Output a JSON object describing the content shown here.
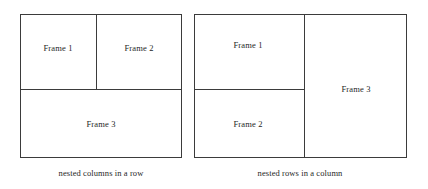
{
  "figure": {
    "background_color": "#ffffff",
    "line_color": "#3b3b3b",
    "text_color": "#1f1f1f"
  },
  "diagrams": [
    {
      "id": "nested-columns-in-a-row",
      "caption": "nested columns in a row",
      "frames": [
        {
          "label": "Frame 1",
          "position": "top-left"
        },
        {
          "label": "Frame 2",
          "position": "top-right"
        },
        {
          "label": "Frame 3",
          "position": "bottom-full-width"
        }
      ]
    },
    {
      "id": "nested-rows-in-a-column",
      "caption": "nested rows in a column",
      "frames": [
        {
          "label": "Frame 1",
          "position": "top-left"
        },
        {
          "label": "Frame 2",
          "position": "bottom-left"
        },
        {
          "label": "Frame 3",
          "position": "right-full-height"
        }
      ]
    }
  ]
}
